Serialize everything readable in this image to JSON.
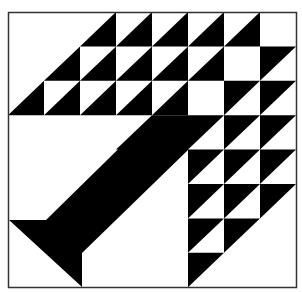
{
  "figure": {
    "colors": {
      "fill": "#000000",
      "background": "#ffffff",
      "border": "#333333"
    }
  },
  "grid": {
    "cols": 8,
    "rows": 8,
    "origin": [
      8,
      12
    ],
    "cell_w": 36,
    "cell_h": 34.4,
    "legend": {
      "W": "white",
      "BR": "black lower-right half",
      "TL": "black upper-left half",
      "B": "solid black"
    },
    "cells": [
      [
        "W",
        "W",
        "BR",
        "BR",
        "BR",
        "BR",
        "BR",
        "W"
      ],
      [
        "W",
        "BR",
        "BR",
        "BR",
        "BR",
        "BR",
        "W",
        "TL"
      ],
      [
        "BR",
        "BR",
        "BR",
        "BR",
        "BR",
        "W",
        "TL",
        "TL"
      ],
      [
        "W",
        "W",
        "W",
        "BR",
        "B",
        "TL",
        "TL",
        "TL"
      ],
      [
        "W",
        "W",
        "W",
        "W",
        "W",
        "TL",
        "TL",
        "TL"
      ],
      [
        "W",
        "W",
        "W",
        "W",
        "W",
        "TL",
        "TL",
        "TL"
      ],
      [
        "W",
        "W",
        "W",
        "W",
        "W",
        "TL",
        "TL",
        "W"
      ],
      [
        "W",
        "W",
        "W",
        "W",
        "W",
        "TL",
        "W",
        "W"
      ]
    ]
  },
  "band": {
    "points": [
      [
        9,
        220
      ],
      [
        46,
        220
      ],
      [
        152,
        116
      ],
      [
        188,
        116
      ],
      [
        188,
        150
      ],
      [
        82,
        253
      ],
      [
        82,
        287
      ]
    ]
  }
}
